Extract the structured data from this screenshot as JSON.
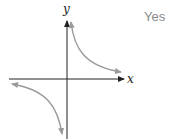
{
  "graph": {
    "x_axis_label": "x",
    "y_axis_label": "y",
    "curve_color": "#9a9a9a",
    "axis_color": "#222222",
    "description": "Hyperbola with branches in quadrants I and III, asymptotic to both axes"
  },
  "answer": {
    "text": "Yes",
    "color": "#8a8a8a"
  }
}
